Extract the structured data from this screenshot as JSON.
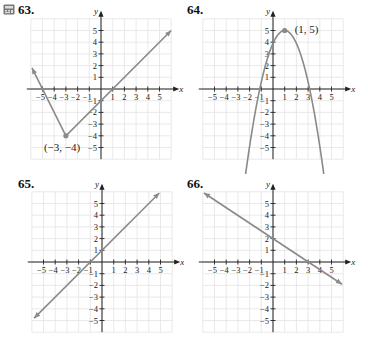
{
  "colors": {
    "grid": "#e3e3e3",
    "axis": "#222222",
    "curve": "#8a8a8a",
    "point": "#8a8a8a",
    "text": "#222222"
  },
  "chart_data": [
    {
      "id": "63",
      "label": "63.",
      "type": "line",
      "title": "",
      "xlabel": "x",
      "ylabel": "y",
      "xlim": [
        -6,
        6
      ],
      "ylim": [
        -6,
        6
      ],
      "grid": true,
      "xticks": [
        -5,
        -4,
        -3,
        -2,
        -1,
        1,
        2,
        3,
        4,
        5
      ],
      "yticks": [
        -5,
        -4,
        -3,
        -2,
        -1,
        1,
        2,
        3,
        4,
        5
      ],
      "series": [
        {
          "name": "absolute value V",
          "points": [
            [
              -5.9,
              1.8
            ],
            [
              -3,
              -4
            ],
            [
              6,
              5
            ]
          ],
          "arrows": "both"
        }
      ],
      "annotations": [
        {
          "text": "(−3, −4)",
          "x": -3,
          "y": -4,
          "marker": true
        }
      ],
      "has_calculator_icon": true
    },
    {
      "id": "64",
      "label": "64.",
      "type": "line",
      "title": "",
      "xlabel": "x",
      "ylabel": "y",
      "xlim": [
        -6,
        6
      ],
      "ylim": [
        -6,
        6
      ],
      "grid": true,
      "xticks": [
        -5,
        -4,
        -3,
        -2,
        -1,
        1,
        2,
        3,
        4,
        5
      ],
      "yticks": [
        -5,
        -4,
        -3,
        -2,
        -1,
        1,
        2,
        3,
        4,
        5
      ],
      "series": [
        {
          "name": "parabola",
          "function": "5 - 1.1*(x-1)^2",
          "domain": [
            -2.8,
            4.8
          ],
          "vertex": [
            1,
            5
          ],
          "arrows": "both"
        }
      ],
      "annotations": [
        {
          "text": "(1, 5)",
          "x": 1,
          "y": 5,
          "marker": true
        }
      ]
    },
    {
      "id": "65",
      "label": "65.",
      "type": "line",
      "title": "",
      "xlabel": "x",
      "ylabel": "y",
      "xlim": [
        -6,
        6
      ],
      "ylim": [
        -6,
        6
      ],
      "grid": true,
      "xticks": [
        -5,
        -4,
        -3,
        -2,
        -1,
        1,
        2,
        3,
        4,
        5
      ],
      "yticks": [
        -5,
        -4,
        -3,
        -2,
        -1,
        1,
        2,
        3,
        4,
        5
      ],
      "series": [
        {
          "name": "line",
          "points": [
            [
              -5.8,
              -4.8
            ],
            [
              4.9,
              5.9
            ]
          ],
          "slope": 1,
          "intercept": 1,
          "arrows": "both"
        }
      ],
      "annotations": []
    },
    {
      "id": "66",
      "label": "66.",
      "type": "line",
      "title": "",
      "xlabel": "x",
      "ylabel": "y",
      "xlim": [
        -6,
        6
      ],
      "ylim": [
        -6,
        6
      ],
      "grid": true,
      "xticks": [
        -5,
        -4,
        -3,
        -2,
        -1,
        1,
        2,
        3,
        4,
        5
      ],
      "yticks": [
        -5,
        -4,
        -3,
        -2,
        -1,
        1,
        2,
        3,
        4,
        5
      ],
      "series": [
        {
          "name": "line",
          "points": [
            [
              -5.9,
              5.9
            ],
            [
              5.9,
              -1.9
            ]
          ],
          "slope": -0.6667,
          "intercept": 2,
          "arrows": "both"
        }
      ],
      "annotations": []
    }
  ]
}
